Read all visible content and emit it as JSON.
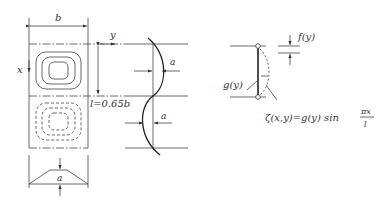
{
  "left_panel": {
    "width_label": "b",
    "x_axis_label": "x",
    "y_axis_label": "y",
    "length_label": "l=0.65b",
    "amplitude_label": "a"
  },
  "middle_panel": {
    "amplitude_label_top": "a",
    "amplitude_label_bottom": "a"
  },
  "right_panel": {
    "f_label": "f(y)",
    "g_label": "g(y)",
    "formula_main": "ζ(x,y)=g(y) sin ",
    "formula_frac_num": "πx",
    "formula_frac_den": "l"
  }
}
